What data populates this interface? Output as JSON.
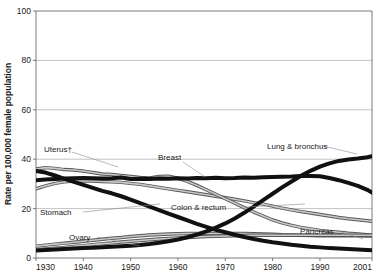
{
  "chart_data": {
    "type": "line",
    "title": "",
    "xlabel": "",
    "ylabel": "Rate per 100,000 female population",
    "xlim": [
      1930,
      2001
    ],
    "ylim": [
      0,
      100
    ],
    "grid": true,
    "legend_position": "inline-annotations",
    "x_ticks": [
      "1930",
      "1940",
      "1950",
      "1960",
      "1970",
      "1980",
      "1990",
      "2001"
    ],
    "x_tick_values": [
      1930,
      1940,
      1950,
      1960,
      1970,
      1980,
      1990,
      2001
    ],
    "y_ticks": [
      "0",
      "20",
      "40",
      "60",
      "80",
      "100"
    ],
    "y_tick_values": [
      0,
      20,
      40,
      60,
      80,
      100
    ],
    "x": [
      1930,
      1932,
      1934,
      1936,
      1938,
      1940,
      1942,
      1944,
      1946,
      1948,
      1950,
      1952,
      1954,
      1956,
      1958,
      1960,
      1962,
      1964,
      1966,
      1968,
      1970,
      1972,
      1974,
      1976,
      1978,
      1980,
      1982,
      1984,
      1986,
      1988,
      1990,
      1992,
      1994,
      1996,
      1998,
      2000,
      2001
    ],
    "series": [
      {
        "name": "Lung & bronchus",
        "label": "Lung & bronchus",
        "color": "#1a1a1a",
        "emphasis": "bold",
        "values": [
          3.0,
          3.2,
          3.4,
          3.6,
          3.8,
          4.0,
          4.2,
          4.4,
          4.6,
          4.8,
          5.0,
          5.3,
          5.7,
          6.2,
          6.8,
          7.5,
          8.4,
          9.5,
          10.8,
          12.3,
          14.0,
          16.0,
          18.3,
          20.8,
          23.4,
          26.0,
          28.6,
          31.0,
          33.3,
          35.3,
          37.0,
          38.3,
          39.3,
          39.9,
          40.3,
          40.8,
          41.2
        ]
      },
      {
        "name": "Breast",
        "label": "Breast",
        "color": "#2b2b2b",
        "emphasis": "bold",
        "values": [
          31.5,
          31.8,
          32.0,
          32.2,
          32.3,
          32.4,
          32.3,
          32.2,
          32.3,
          32.6,
          32.0,
          32.1,
          32.0,
          32.2,
          32.1,
          32.3,
          32.2,
          32.4,
          32.3,
          32.5,
          32.3,
          32.4,
          32.6,
          32.5,
          32.7,
          32.8,
          32.9,
          33.0,
          33.2,
          33.2,
          33.1,
          32.4,
          31.5,
          30.4,
          29.2,
          27.6,
          26.5
        ]
      },
      {
        "name": "Uterus",
        "label": "Uterus†",
        "color": "#555555",
        "emphasis": "normal",
        "values": [
          36.0,
          36.6,
          36.3,
          35.8,
          35.6,
          35.2,
          34.6,
          34.0,
          33.8,
          33.4,
          33.0,
          32.6,
          32.4,
          33.0,
          33.1,
          32.3,
          31.0,
          29.4,
          27.6,
          25.8,
          24.0,
          22.2,
          20.4,
          18.6,
          17.0,
          15.4,
          14.2,
          13.2,
          12.4,
          11.8,
          11.2,
          10.8,
          10.4,
          10.0,
          9.7,
          9.4,
          9.2
        ]
      },
      {
        "name": "Stomach",
        "label": "Stomach",
        "color": "#1a1a1a",
        "emphasis": "bold",
        "values": [
          35.2,
          34.6,
          33.4,
          32.0,
          30.8,
          29.6,
          28.4,
          27.2,
          26.2,
          25.0,
          23.6,
          22.2,
          20.8,
          19.4,
          18.0,
          16.6,
          15.2,
          13.8,
          12.6,
          11.4,
          10.4,
          9.4,
          8.5,
          7.7,
          7.0,
          6.4,
          5.9,
          5.4,
          5.0,
          4.6,
          4.3,
          4.0,
          3.8,
          3.6,
          3.4,
          3.2,
          3.1
        ]
      },
      {
        "name": "Colon & rectum",
        "label": "Colon & rectum",
        "color": "#6a6a6a",
        "emphasis": "normal",
        "values": [
          28.0,
          29.2,
          30.2,
          30.8,
          31.2,
          31.3,
          31.2,
          31.0,
          30.8,
          30.6,
          30.2,
          29.8,
          29.2,
          28.6,
          28.0,
          27.4,
          26.8,
          26.2,
          25.6,
          25.0,
          24.4,
          23.8,
          23.1,
          22.4,
          21.8,
          21.0,
          20.2,
          19.5,
          18.8,
          18.2,
          17.6,
          17.0,
          16.4,
          15.9,
          15.5,
          15.1,
          14.9
        ]
      },
      {
        "name": "Ovary",
        "label": "Ovary",
        "color": "#8a8a8a",
        "emphasis": "normal",
        "values": [
          4.8,
          5.2,
          5.6,
          6.0,
          6.4,
          6.8,
          7.2,
          7.6,
          8.0,
          8.3,
          8.7,
          9.0,
          9.3,
          9.5,
          9.7,
          9.8,
          9.9,
          9.9,
          9.9,
          9.9,
          9.9,
          9.9,
          9.9,
          9.8,
          9.7,
          9.6,
          9.4,
          9.3,
          9.2,
          9.1,
          9.0,
          9.0,
          9.0,
          9.0,
          9.0,
          8.9,
          8.9
        ]
      },
      {
        "name": "Pancreas",
        "label": "Pancreas",
        "color": "#4a4a4a",
        "emphasis": "normal",
        "values": [
          3.4,
          3.7,
          4.0,
          4.3,
          4.7,
          5.0,
          5.4,
          5.8,
          6.1,
          6.5,
          6.8,
          7.1,
          7.4,
          7.7,
          7.9,
          8.1,
          8.3,
          8.5,
          8.7,
          8.8,
          8.9,
          9.0,
          9.1,
          9.2,
          9.2,
          9.2,
          9.2,
          9.2,
          9.2,
          9.2,
          9.2,
          9.2,
          9.2,
          9.2,
          9.2,
          9.2,
          9.2
        ]
      }
    ],
    "annotations": [
      {
        "text": "Uterus†",
        "series": "Uterus"
      },
      {
        "text": "Breast",
        "series": "Breast"
      },
      {
        "text": "Stomach",
        "series": "Stomach"
      },
      {
        "text": "Colon & rectum",
        "series": "Colon & rectum"
      },
      {
        "text": "Ovary",
        "series": "Ovary"
      },
      {
        "text": "Lung & bronchus",
        "series": "Lung & bronchus"
      },
      {
        "text": "Pancreas",
        "series": "Pancreas"
      }
    ]
  },
  "axis": {
    "y_title": "Rate per 100,000 female population"
  },
  "labels": {
    "uterus": "Uterus†",
    "breast": "Breast",
    "stomach": "Stomach",
    "colon_rectum": "Colon & rectum",
    "ovary": "Ovary",
    "lung_bronchus": "Lung & bronchus",
    "pancreas": "Pancreas"
  },
  "ticks": {
    "y": [
      "100",
      "80",
      "60",
      "40",
      "20",
      "0"
    ],
    "x": [
      "1930",
      "1940",
      "1950",
      "1960",
      "1970",
      "1980",
      "1990",
      "2001"
    ]
  }
}
